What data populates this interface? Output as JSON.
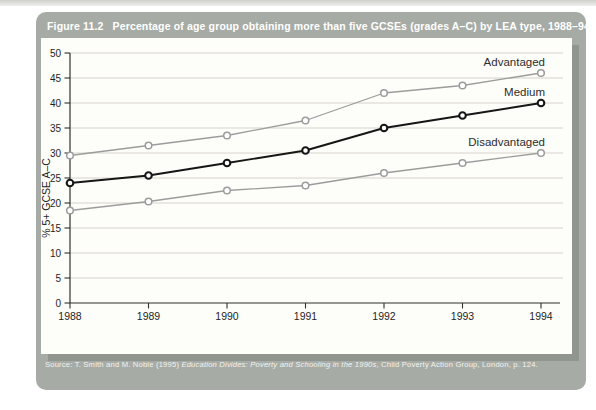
{
  "figure": {
    "number": "Figure 11.2",
    "caption": "Percentage of age group obtaining more than five GCSEs (grades A–C) by LEA type, 1988–94",
    "source_prefix": "Source: T. Smith and M. Noble (1995) ",
    "source_title": "Education Divides: Poverty and Schooling in the 1990s",
    "source_suffix": ", Child Poverty Action Group, London, p. 124."
  },
  "chart_data": {
    "type": "line",
    "x": [
      1988,
      1989,
      1990,
      1991,
      1992,
      1993,
      1994
    ],
    "series": [
      {
        "name": "Advantaged",
        "values": [
          29.5,
          31.5,
          33.5,
          36.5,
          42.0,
          43.5,
          46.0
        ],
        "color": "#9c9c9c",
        "line_width": 1.3
      },
      {
        "name": "Medium",
        "values": [
          24.0,
          25.5,
          28.0,
          30.5,
          35.0,
          37.5,
          40.0
        ],
        "color": "#161616",
        "line_width": 1.9
      },
      {
        "name": "Disadvantaged",
        "values": [
          18.5,
          20.3,
          22.5,
          23.5,
          26.0,
          28.0,
          30.0
        ],
        "color": "#9c9c9c",
        "line_width": 1.3
      }
    ],
    "title": "",
    "xlabel": "",
    "ylabel": "% 5+ GCSE A–C",
    "ylim": [
      0,
      50
    ],
    "ytick_step": 5,
    "grid": true,
    "marker": "open-circle",
    "legend_position": "end-of-line-labels"
  },
  "colors": {
    "card_bg": "#a7aba5",
    "title_text": "#ffffff",
    "panel_bg": "#fdfdfa",
    "panel_shadow": "#90958f",
    "gridline": "#d7d3c9",
    "axis": "#2f2f2f",
    "tick_text": "#1f1f1f",
    "series_label_text": "#2d2d2d",
    "source_text": "#f3f3f0",
    "marker_fill": "#ffffff"
  }
}
